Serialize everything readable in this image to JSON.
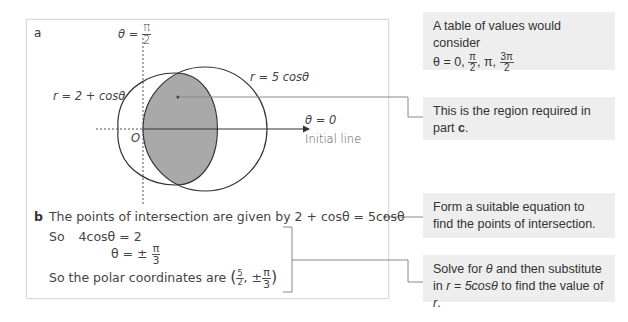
{
  "part_a": {
    "label": "a",
    "axis_top_label": {
      "lhs": "θ =",
      "num": "π",
      "den": "2"
    },
    "curve1_label": "r = 2 + cosθ",
    "curve2_label": "r = 5 cosθ",
    "initial_theta_label": "θ = 0",
    "initial_line_label": "Initial line",
    "pole_label": "O"
  },
  "part_b": {
    "label": "b",
    "line1": "The points of intersection are given by 2 + cosθ = 5cosθ",
    "line2_prefix": "So",
    "line2_eq": "4cosθ = 2",
    "line3_lhs": "θ = ±",
    "line3_num": "π",
    "line3_den": "3",
    "line4_prefix": "So the polar coordinates are",
    "line4_r_num": "5",
    "line4_r_den": "2",
    "line4_pm": "±",
    "line4_t_num": "π",
    "line4_t_den": "3"
  },
  "notes": [
    {
      "text_line1": "A table of values would consider",
      "text_line2_prefix": "θ = 0,",
      "frac1_num": "π",
      "frac1_den": "2",
      "mid": ", π,",
      "frac2_num": "3π",
      "frac2_den": "2"
    },
    {
      "text": "This is the region required in part",
      "bold": "c",
      "suffix": "."
    },
    {
      "text": "Form a suitable equation to find the points of intersection."
    },
    {
      "text_prefix": "Solve for",
      "theta": "θ",
      "text_mid": "and then substitute in",
      "eq": "r = 5cosθ",
      "text_suffix": "to find the value of",
      "r": "r",
      "end": "."
    }
  ],
  "colors": {
    "shaded_region": "#a9a9a9",
    "note_background": "#eeeeee",
    "line": "#333333",
    "leader_line": "#888888"
  }
}
